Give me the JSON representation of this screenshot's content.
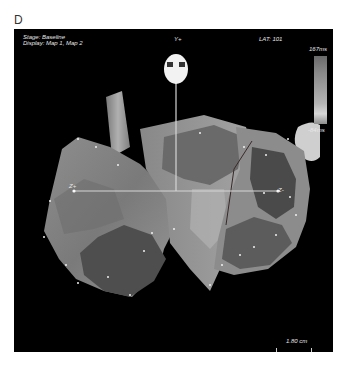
{
  "figure": {
    "panel_letter": "D"
  },
  "viewport": {
    "stage_text": "Stage: Baseline",
    "display_text": "Display: Map 1, Map 2",
    "top_axis_label": "Y+",
    "lat_text": "LAT: 101",
    "left_axis_label": "Z+",
    "right_axis_label": "Z-",
    "colorbar": {
      "max_label": "167ms",
      "min_label": "-84ms"
    },
    "scale": {
      "label": "1.80 cm"
    }
  },
  "colors": {
    "background": "#000000",
    "text": "#e8e8e8",
    "axis_line": "#d0d0d0"
  }
}
